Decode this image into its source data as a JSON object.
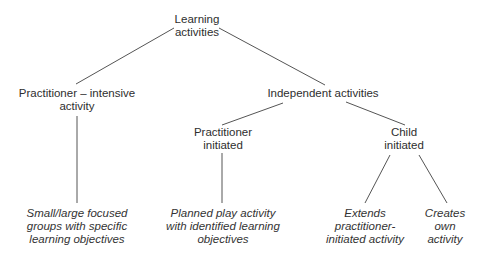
{
  "colors": {
    "background": "#ffffff",
    "text": "#2e2e2e",
    "connector": "#555555"
  },
  "nodes": {
    "root": {
      "lines": [
        "Learning",
        "activities"
      ]
    },
    "practitioner_intensive": {
      "lines": [
        "Practitioner – intensive",
        "activity"
      ]
    },
    "independent": {
      "lines": [
        "Independent activities"
      ]
    },
    "practitioner_initiated": {
      "lines": [
        "Practitioner",
        "initiated"
      ]
    },
    "child_initiated": {
      "lines": [
        "Child",
        "initiated"
      ]
    },
    "leaf_focused_groups": {
      "lines": [
        "Small/large focused",
        "groups with specific",
        "learning objectives"
      ]
    },
    "leaf_planned_play": {
      "lines": [
        "Planned play activity",
        "with identified learning",
        "objectives"
      ]
    },
    "leaf_extends": {
      "lines": [
        "Extends",
        "practitioner-",
        "initiated activity"
      ]
    },
    "leaf_creates": {
      "lines": [
        "Creates",
        "own",
        "activity"
      ]
    }
  },
  "edges": [
    {
      "from": "root",
      "to": "practitioner_intensive"
    },
    {
      "from": "root",
      "to": "independent"
    },
    {
      "from": "practitioner_intensive",
      "to": "leaf_focused_groups"
    },
    {
      "from": "independent",
      "to": "practitioner_initiated"
    },
    {
      "from": "independent",
      "to": "child_initiated"
    },
    {
      "from": "practitioner_initiated",
      "to": "leaf_planned_play"
    },
    {
      "from": "child_initiated",
      "to": "leaf_extends"
    },
    {
      "from": "child_initiated",
      "to": "leaf_creates"
    }
  ]
}
